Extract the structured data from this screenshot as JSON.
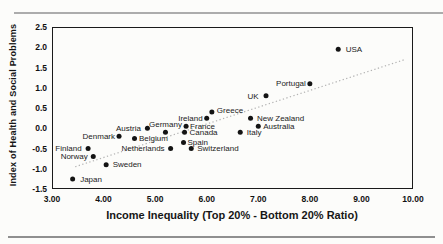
{
  "chart_data": {
    "type": "scatter",
    "title": "",
    "xlabel": "Income Inequality (Top 20% - Bottom 20% Ratio)",
    "ylabel": "Index of Health and Social Problems",
    "xlim": [
      3,
      10
    ],
    "ylim": [
      -1.5,
      2.5
    ],
    "x_ticks": [
      {
        "value": 3,
        "label": "3.00"
      },
      {
        "value": 4,
        "label": "4.00"
      },
      {
        "value": 5,
        "label": "5.00"
      },
      {
        "value": 6,
        "label": "6.00"
      },
      {
        "value": 7,
        "label": "7.00"
      },
      {
        "value": 8,
        "label": "8.00"
      },
      {
        "value": 9,
        "label": "9.00"
      },
      {
        "value": 10,
        "label": "10.00"
      }
    ],
    "y_ticks": [
      {
        "value": 2.5,
        "label": "2.5"
      },
      {
        "value": 2.0,
        "label": "2.0"
      },
      {
        "value": 1.5,
        "label": "1.5"
      },
      {
        "value": 1.0,
        "label": "1.0"
      },
      {
        "value": 0.5,
        "label": "0.5"
      },
      {
        "value": 0.0,
        "label": "0.0"
      },
      {
        "value": -0.5,
        "label": "-0.5"
      },
      {
        "value": -1.0,
        "label": "-1.0"
      },
      {
        "value": -1.5,
        "label": "-1.5"
      }
    ],
    "grid": false,
    "legend": "none",
    "marker_color": "#141414",
    "trendline": {
      "style": "dotted",
      "color": "#b3b3b3",
      "x1": 3.45,
      "y1": -0.95,
      "x2": 9.85,
      "y2": 1.7
    },
    "points": [
      {
        "label": "Japan",
        "x": 3.4,
        "y": -1.25,
        "label_side": "right",
        "gap": 5
      },
      {
        "label": "Finland",
        "x": 3.7,
        "y": -0.5,
        "label_side": "left",
        "gap": 4
      },
      {
        "label": "Norway",
        "x": 3.8,
        "y": -0.7,
        "label_side": "left",
        "gap": 3
      },
      {
        "label": "Sweden",
        "x": 4.05,
        "y": -0.9,
        "label_side": "right",
        "gap": 4
      },
      {
        "label": "Denmark",
        "x": 4.3,
        "y": -0.2,
        "label_side": "left",
        "gap": 1.5
      },
      {
        "label": "Belgium",
        "x": 4.6,
        "y": -0.25,
        "label_side": "right",
        "gap": 2
      },
      {
        "label": "Austria",
        "x": 4.85,
        "y": 0.0,
        "label_side": "left",
        "gap": 4
      },
      {
        "label": "Germany",
        "x": 5.2,
        "y": -0.1,
        "label_side": "above"
      },
      {
        "label": "Netherlands",
        "x": 5.3,
        "y": -0.5,
        "label_side": "left",
        "gap": 3.5
      },
      {
        "label": "Spain",
        "x": 5.55,
        "y": -0.35,
        "label_side": "right",
        "gap": 1.5
      },
      {
        "label": "France",
        "x": 5.6,
        "y": 0.05,
        "label_side": "right",
        "gap": 1.5
      },
      {
        "label": "Canada",
        "x": 5.57,
        "y": -0.1,
        "label_side": "right",
        "gap": 2.5
      },
      {
        "label": "Switzerland",
        "x": 5.7,
        "y": -0.5,
        "label_side": "right",
        "gap": 3.5
      },
      {
        "label": "Ireland",
        "x": 6.0,
        "y": 0.25,
        "label_side": "left",
        "gap": 1.5
      },
      {
        "label": "Greece",
        "x": 6.1,
        "y": 0.4,
        "label_side": "right",
        "gap": 2.5,
        "label_dy": -2
      },
      {
        "label": "Italy",
        "x": 6.65,
        "y": -0.1,
        "label_side": "right",
        "gap": 4
      },
      {
        "label": "New Zealand",
        "x": 6.85,
        "y": 0.25,
        "label_side": "right",
        "gap": 4
      },
      {
        "label": "Australia",
        "x": 7.0,
        "y": 0.05,
        "label_side": "right",
        "gap": 2.5
      },
      {
        "label": "UK",
        "x": 7.15,
        "y": 0.8,
        "label_side": "left",
        "gap": 5
      },
      {
        "label": "Portugal",
        "x": 8.0,
        "y": 1.1,
        "label_side": "left",
        "gap": 1.5
      },
      {
        "label": "USA",
        "x": 8.55,
        "y": 1.95,
        "label_side": "right",
        "gap": 5
      }
    ]
  }
}
